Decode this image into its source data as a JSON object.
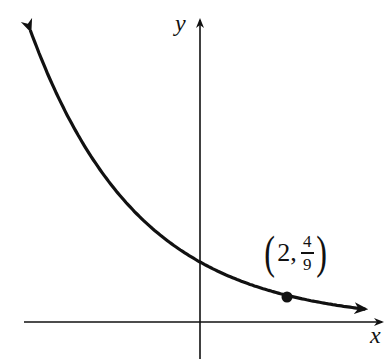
{
  "chart_data": {
    "type": "line",
    "title": "",
    "function": "y = (2/3)^x",
    "xlabel": "x",
    "ylabel": "y",
    "series": [
      {
        "name": "exponential decay",
        "x": [
          -3.9,
          -3,
          -2,
          -1,
          0,
          1,
          2,
          3,
          3.8
        ],
        "values": [
          4.86,
          3.375,
          2.25,
          1.5,
          1,
          0.667,
          0.444,
          0.296,
          0.214
        ]
      }
    ],
    "annotations": [
      {
        "label": "(2, 4/9)",
        "x": 2,
        "y": 0.444
      }
    ],
    "grid": false,
    "xlim": [
      -4.1,
      4.2
    ],
    "ylim": [
      -0.6,
      5.3
    ]
  },
  "labels": {
    "x_axis": "x",
    "y_axis": "y",
    "point_x": "2,",
    "point_num": "4",
    "point_den": "9",
    "lparen": "(",
    "rparen": ")"
  },
  "colors": {
    "ink": "#111111",
    "background": "#ffffff"
  }
}
